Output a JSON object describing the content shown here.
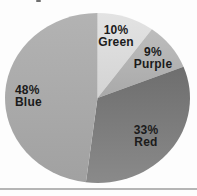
{
  "page": {
    "background": "#fdfdfd",
    "text_color": "#1b1b1b",
    "bottom_rule_color": "#b5b5b5",
    "top_speck_color": "#6f6f6f"
  },
  "chart_data": {
    "type": "pie",
    "title": "",
    "legend": "none",
    "labels_inside": true,
    "start_angle_deg": 0,
    "direction": "clockwise",
    "slices": [
      {
        "label": "Green",
        "value": 10,
        "pct_label": "10%",
        "color": "#e3e3e3",
        "color2": "#d3d3d3"
      },
      {
        "label": "Purple",
        "value": 9,
        "pct_label": "9%",
        "color": "#bdbdbd",
        "color2": "#a9a9a9"
      },
      {
        "label": "Red",
        "value": 33,
        "pct_label": "33%",
        "color": "#6e6e6e",
        "color2": "#8a8a8a"
      },
      {
        "label": "Blue",
        "value": 48,
        "pct_label": "48%",
        "color": "#b3b3b3",
        "color2": "#a1a1a1"
      }
    ]
  }
}
